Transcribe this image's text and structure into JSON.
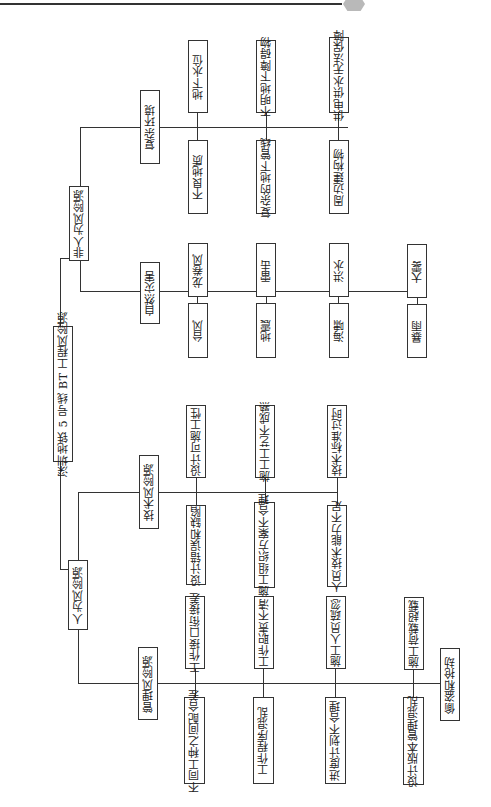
{
  "decoration": {
    "ornament_color": "#b9b9b9"
  },
  "root": {
    "label": "深圳地铁 5 号线 BT 工程风险源"
  },
  "level2": {
    "non_human": "非人为风险源",
    "human": "人为风险源"
  },
  "groups": {
    "complex_env": {
      "label": "复杂环境",
      "items": [
        "地下水位",
        "不良地质",
        "不明地下障碍物",
        "复杂的地下管线",
        "供电供水无法保障",
        "周边建构物"
      ]
    },
    "natural_disaster": {
      "label": "自然灾害",
      "items": [
        "龙卷风",
        "台风",
        "雷击",
        "地震",
        "洪水",
        "海啸",
        "大雾",
        "暴雨"
      ]
    },
    "technical": {
      "label": "技术风险源",
      "items": [
        "设计可施工性",
        "设计错误和缺陷",
        "施工工艺不成熟",
        "施工组织方案不合理",
        "技术标准过时",
        "人员技术能力不足"
      ]
    },
    "management": {
      "label": "管理风险源",
      "items": [
        "工作接口衔接差",
        "不同工种之间配合差",
        "工作职责不清",
        "工作程序混乱",
        "施工人员疏忽",
        "进度计划不合理",
        "施工荷载超载",
        "设计版本管理混乱",
        "偷盗和抢劫"
      ]
    }
  }
}
